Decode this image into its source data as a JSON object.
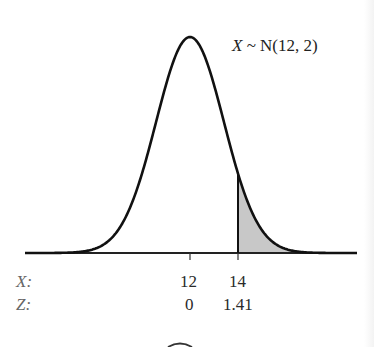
{
  "chart_data": {
    "type": "area",
    "title": "",
    "distribution_label": "X ~ N(12, 2)",
    "distribution": {
      "name": "Normal",
      "mean": 12,
      "variance": 2,
      "sd": 1.414
    },
    "shaded_region": {
      "from_x": 14,
      "to_x": "+inf",
      "side": "right",
      "fill": "#c8c8c8"
    },
    "xaxis": {
      "row_labels": [
        "X:",
        "Z:"
      ],
      "ticks": [
        {
          "x": 12,
          "z": "0"
        },
        {
          "x": 14,
          "z": "1.41"
        }
      ]
    },
    "grid": false,
    "legend": null
  },
  "labels": {
    "distribution_var": "X",
    "distribution_rest": "~ N(12, 2)",
    "row_x": "X:",
    "row_z": "Z:",
    "tick_x_12": "12",
    "tick_x_14": "14",
    "tick_z_12": "0",
    "tick_z_14": "1.41"
  },
  "colors": {
    "curve": "#111111",
    "shade": "#c8c8c8",
    "text": "#2a2a2a"
  }
}
